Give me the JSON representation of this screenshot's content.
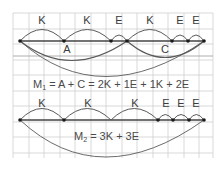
{
  "diagram": {
    "top": {
      "arc_labels": [
        "K",
        "K",
        "E",
        "K",
        "E",
        "E"
      ],
      "chord_labels": [
        "A",
        "C"
      ],
      "formula": {
        "symbol": "M",
        "subscript": "1",
        "rhs": " = A + C = 2K + 1E + 1K + 2E"
      }
    },
    "bottom": {
      "arc_labels": [
        "K",
        "K",
        "K",
        "E",
        "E",
        "E"
      ],
      "formula": {
        "symbol": "M",
        "subscript": "2",
        "rhs": " = 3K + 3E"
      }
    }
  },
  "colors": {
    "grid": "#c8c8c8",
    "line": "#555555",
    "node": "#1a1a1a",
    "text": "#3a3a3a"
  }
}
